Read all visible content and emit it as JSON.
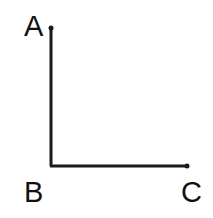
{
  "diagram": {
    "type": "right-angle",
    "stroke_color": "#1a1a1a",
    "points": [
      {
        "id": "A",
        "label": "A",
        "x": 51,
        "y": 28
      },
      {
        "id": "B",
        "label": "B",
        "x": 51,
        "y": 166
      },
      {
        "id": "C",
        "label": "C",
        "x": 187,
        "y": 166
      }
    ],
    "segments": [
      {
        "from": "A",
        "to": "B"
      },
      {
        "from": "B",
        "to": "C"
      }
    ],
    "labels": {
      "a": "A",
      "b": "B",
      "c": "C"
    }
  }
}
